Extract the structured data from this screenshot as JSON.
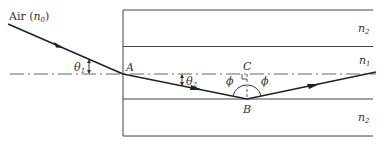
{
  "diagram": {
    "labels": {
      "air": "Air (",
      "n0_main": "n",
      "n0_sub": "0",
      "air_close": ")",
      "theta1_main": "θ",
      "theta1_sub": "1",
      "theta2_main": "θ",
      "theta2_sub": "2",
      "point_a": "A",
      "point_b": "B",
      "point_c": "C",
      "phi_left": "ϕ",
      "phi_right": "ϕ",
      "cladding_top_main": "n",
      "cladding_top_sub": "2",
      "core_main": "n",
      "core_sub": "1",
      "cladding_bottom_main": "n",
      "cladding_bottom_sub": "2"
    },
    "colors": {
      "line": "#333333",
      "ray": "#222222",
      "background": "#ffffff"
    }
  }
}
